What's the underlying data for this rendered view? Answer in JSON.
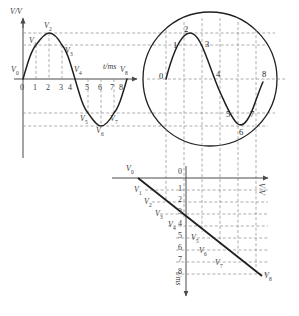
{
  "figure": {
    "colors": {
      "curve": "#1f1f1f",
      "axis": "#4a4a4a",
      "dashed": "#7d7d7d",
      "text": "#3a3a3a"
    }
  },
  "wave_plot": {
    "y_axis_label": "V/V",
    "x_axis_label": "t/ms",
    "tick_labels": [
      "0",
      "1",
      "2",
      "3",
      "4",
      "5",
      "6",
      "7",
      "8"
    ],
    "point_labels": [
      "V0",
      "V1",
      "V2",
      "V3",
      "V4",
      "V5",
      "V6",
      "V7",
      "V8"
    ]
  },
  "magnifier": {
    "point_numbers": [
      "0",
      "1",
      "2",
      "3",
      "4",
      "5",
      "6",
      "7",
      "8"
    ]
  },
  "projection_plot": {
    "h_axis_label": "V/V",
    "v_axis_label": "t/ms",
    "tick_labels": [
      "0",
      "1",
      "2",
      "3",
      "4",
      "5",
      "6",
      "7",
      "8"
    ],
    "point_labels": [
      "V0",
      "V1",
      "V2",
      "V3",
      "V4",
      "V5",
      "V6",
      "V7",
      "V8"
    ]
  },
  "chart_data": {
    "type": "line",
    "panels": [
      {
        "name": "wave_plot",
        "type": "line",
        "xlabel": "t/ms",
        "ylabel": "V/V",
        "xlim": [
          0,
          8.6
        ],
        "ylim": [
          -1.15,
          1.25
        ],
        "grid": "dashed-guides",
        "x": [
          0,
          1,
          2,
          3,
          4,
          5,
          6,
          7,
          8
        ],
        "y": [
          0,
          0.707,
          1.0,
          0.707,
          0,
          -0.707,
          -1.0,
          -0.707,
          0
        ],
        "point_labels": [
          "V0",
          "V1",
          "V2",
          "V3",
          "V4",
          "V5",
          "V6",
          "V7",
          "V8"
        ],
        "tick_labels": [
          "0",
          "1",
          "2",
          "3",
          "4",
          "5",
          "6",
          "7",
          "8"
        ]
      },
      {
        "name": "magnifier_circle",
        "type": "line",
        "note": "magnified copy of one sine period inside a circle",
        "x": [
          0,
          1,
          2,
          3,
          4,
          5,
          6,
          7,
          8
        ],
        "y": [
          0,
          0.707,
          1.0,
          0.707,
          0,
          -0.707,
          -1.0,
          -0.707,
          0
        ],
        "point_labels": [
          "0",
          "1",
          "2",
          "3",
          "4",
          "5",
          "6",
          "7",
          "8"
        ]
      },
      {
        "name": "projection_plot",
        "type": "line",
        "xlabel": "V/V",
        "ylabel": "t/ms",
        "note": "straight diagonal line V = f(t) projected from the waveform",
        "t": [
          0,
          1,
          2,
          3,
          4,
          5,
          6,
          7,
          8
        ],
        "v": [
          0,
          1,
          2,
          3,
          4,
          5,
          6,
          7,
          8
        ],
        "point_labels": [
          "V0",
          "V1",
          "V2",
          "V3",
          "V4",
          "V5",
          "V6",
          "V7",
          "V8"
        ],
        "tick_labels": [
          "0",
          "1",
          "2",
          "3",
          "4",
          "5",
          "6",
          "7",
          "8"
        ]
      }
    ]
  }
}
